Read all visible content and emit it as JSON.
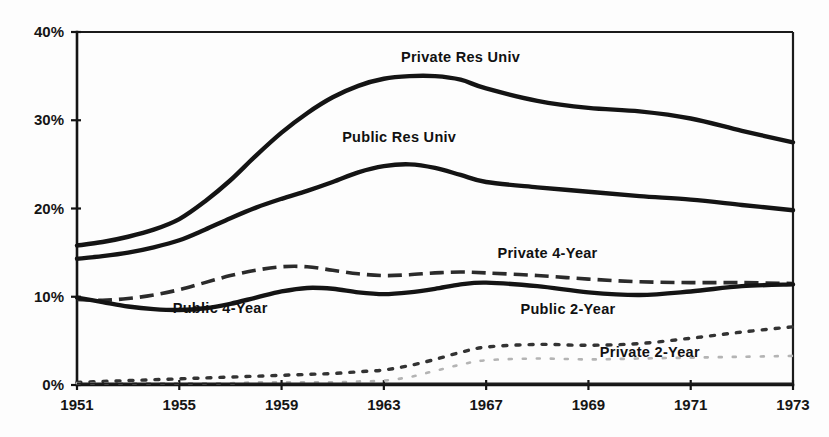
{
  "chart_data": {
    "type": "line",
    "title": "",
    "subtitle": "",
    "xlabel": "",
    "ylabel": "",
    "grid": false,
    "legend_position": "inline-annotations",
    "x_tick_labels": [
      "1951",
      "1955",
      "1959",
      "1963",
      "1967",
      "1969",
      "1971",
      "1973"
    ],
    "x_tick_pixels_uniform": true,
    "y_tick_labels": [
      "0%",
      "10%",
      "20%",
      "30%",
      "40%"
    ],
    "ylim": [
      0,
      40
    ],
    "xlim": [
      1951,
      1973
    ],
    "y_axis_unit": "%",
    "x": [
      1951,
      1952,
      1953,
      1954,
      1955,
      1956,
      1957,
      1958,
      1959,
      1960,
      1961,
      1962,
      1963,
      1964,
      1965,
      1966,
      1967,
      1968,
      1969,
      1970,
      1971,
      1972,
      1973
    ],
    "series": [
      {
        "name": "Private Res Univ",
        "style": "solid-heavy",
        "label_x": 1966.0,
        "label_y": 36.6,
        "values": [
          15.8,
          16.2,
          16.8,
          17.6,
          18.8,
          20.8,
          23.2,
          26.0,
          28.6,
          30.8,
          32.6,
          33.9,
          34.7,
          35.0,
          35.0,
          34.6,
          33.6,
          32.2,
          31.4,
          31.0,
          30.2,
          28.8,
          27.5
        ]
      },
      {
        "name": "Public Res Univ",
        "style": "solid-heavy",
        "label_x": 1963.6,
        "label_y": 27.5,
        "values": [
          14.3,
          14.6,
          15.0,
          15.6,
          16.4,
          17.6,
          18.9,
          20.1,
          21.1,
          22.0,
          23.0,
          24.1,
          24.8,
          25.0,
          24.6,
          23.8,
          23.0,
          22.4,
          21.9,
          21.4,
          21.0,
          20.4,
          19.8
        ]
      },
      {
        "name": "Private 4-Year",
        "style": "dashed",
        "label_x": 1968.2,
        "label_y": 14.4,
        "values": [
          9.7,
          9.6,
          9.8,
          10.2,
          10.8,
          11.6,
          12.4,
          13.0,
          13.4,
          13.4,
          13.0,
          12.6,
          12.4,
          12.5,
          12.7,
          12.8,
          12.7,
          12.4,
          12.0,
          11.7,
          11.6,
          11.6,
          11.5
        ]
      },
      {
        "name": "Public 4-Year",
        "style": "solid-heavy",
        "label_x": 1956.6,
        "label_y": 8.2,
        "values": [
          9.9,
          9.4,
          8.9,
          8.6,
          8.5,
          8.7,
          9.2,
          9.9,
          10.6,
          11.0,
          10.9,
          10.5,
          10.3,
          10.5,
          10.9,
          11.4,
          11.6,
          11.2,
          10.5,
          10.2,
          10.6,
          11.2,
          11.4
        ]
      },
      {
        "name": "Public 2-Year",
        "style": "dotted-mid",
        "label_x": 1968.6,
        "label_y": 8.1,
        "values": [
          0.3,
          0.4,
          0.5,
          0.6,
          0.7,
          0.8,
          0.9,
          1.0,
          1.1,
          1.2,
          1.3,
          1.5,
          1.7,
          2.2,
          2.9,
          3.7,
          4.3,
          4.6,
          4.5,
          4.7,
          5.3,
          6.0,
          6.6
        ]
      },
      {
        "name": "Private 2-Year",
        "style": "dotted-faint",
        "label_x": 1970.2,
        "label_y": 3.2,
        "values": [
          0.2,
          0.2,
          0.2,
          0.2,
          0.2,
          0.2,
          0.2,
          0.3,
          0.3,
          0.3,
          0.3,
          0.4,
          0.5,
          0.9,
          1.6,
          2.3,
          2.8,
          3.0,
          2.9,
          3.0,
          3.1,
          3.2,
          3.3
        ]
      }
    ]
  },
  "colors": {
    "ink": "#141414",
    "faint_ink": "#b4b4b4",
    "background": "#fdfdfd"
  }
}
